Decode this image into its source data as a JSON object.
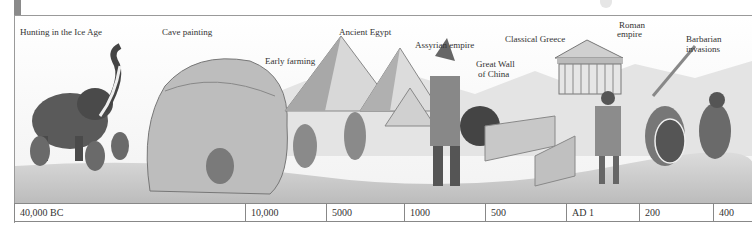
{
  "illustration": {
    "subject": "historical timeline illustration",
    "captions": [
      {
        "id": "ice-age",
        "label": "Hunting in the Ice Age",
        "x": 20,
        "y": 27
      },
      {
        "id": "cave-painting",
        "label": "Cave painting",
        "x": 162,
        "y": 27
      },
      {
        "id": "early-farming",
        "label": "Early farming",
        "x": 265,
        "y": 56
      },
      {
        "id": "ancient-egypt",
        "label": "Ancient Egypt",
        "x": 339,
        "y": 27
      },
      {
        "id": "assyrian-empire",
        "label": "Assyrian empire",
        "x": 415,
        "y": 40
      },
      {
        "id": "great-wall-1",
        "label": "Great Wall",
        "x": 476,
        "y": 59
      },
      {
        "id": "great-wall-2",
        "label": "of China",
        "x": 478,
        "y": 69
      },
      {
        "id": "classical-greece",
        "label": "Classical Greece",
        "x": 505,
        "y": 34
      },
      {
        "id": "roman-empire-1",
        "label": "Roman",
        "x": 617,
        "y": 20
      },
      {
        "id": "roman-empire-2",
        "label": "empire",
        "x": 617,
        "y": 30
      },
      {
        "id": "barbarian-1",
        "label": "Barbarian",
        "x": 686,
        "y": 34
      },
      {
        "id": "barbarian-2",
        "label": "invasions",
        "x": 686,
        "y": 44
      }
    ]
  },
  "timeline": {
    "ticks": [
      {
        "label": "40,000 BC",
        "x": 0,
        "w": 230
      },
      {
        "label": "10,000",
        "x": 230,
        "w": 81
      },
      {
        "label": "5000",
        "x": 311,
        "w": 78
      },
      {
        "label": "1000",
        "x": 389,
        "w": 81
      },
      {
        "label": "500",
        "x": 470,
        "w": 81
      },
      {
        "label": "AD 1",
        "x": 551,
        "w": 73
      },
      {
        "label": "200",
        "x": 624,
        "w": 74
      },
      {
        "label": "400",
        "x": 698,
        "w": 40
      }
    ]
  },
  "colors": {
    "rule": "#888888",
    "sidebar": "#8a8a8a",
    "ink": "#333333"
  }
}
